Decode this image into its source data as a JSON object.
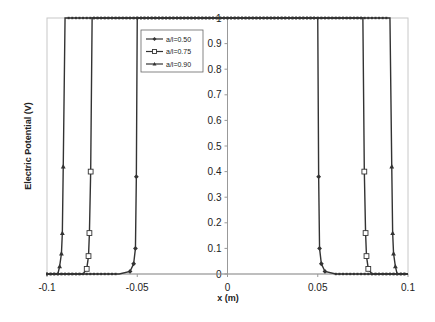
{
  "chart_data": {
    "type": "line",
    "title": "",
    "xlabel": "x (m)",
    "ylabel": "Electric Potential (V)",
    "xlim": [
      -0.1,
      0.1
    ],
    "ylim": [
      0,
      1
    ],
    "xticks": [
      -0.1,
      -0.05,
      0,
      0.05,
      0.1
    ],
    "xtick_labels": [
      "-0.1",
      "-0.05",
      "0",
      "0.05",
      "0.1"
    ],
    "yticks": [
      0,
      0.1,
      0.2,
      0.3,
      0.4,
      0.5,
      0.6,
      0.7,
      0.8,
      0.9,
      1
    ],
    "ytick_labels": [
      "0",
      "0.1",
      "0.2",
      "0.3",
      "0.4",
      "0.5",
      "0.6",
      "0.7",
      "0.8",
      "0.9",
      "1"
    ],
    "grid": false,
    "legend_position": "upper-left-inside",
    "series": [
      {
        "name": "a/l=0.50",
        "marker": "diamond",
        "x": [
          -0.1,
          -0.06,
          -0.054,
          -0.052,
          -0.051,
          -0.0505,
          -0.05,
          -0.0495,
          -0.049,
          0.049,
          0.0495,
          0.05,
          0.0505,
          0.051,
          0.052,
          0.054,
          0.06,
          0.1
        ],
        "values": [
          0,
          0,
          0.01,
          0.04,
          0.1,
          0.38,
          1,
          1,
          1,
          1,
          1,
          1,
          0.38,
          0.1,
          0.04,
          0.01,
          0,
          0
        ]
      },
      {
        "name": "a/l=0.75",
        "marker": "square",
        "x": [
          -0.1,
          -0.08,
          -0.078,
          -0.077,
          -0.0765,
          -0.0758,
          -0.075,
          -0.0745,
          0.0745,
          0.075,
          0.0758,
          0.0765,
          0.077,
          0.078,
          0.08,
          0.1
        ],
        "values": [
          0,
          0,
          0.02,
          0.07,
          0.16,
          0.4,
          1,
          1,
          1,
          1,
          0.4,
          0.16,
          0.07,
          0.02,
          0,
          0
        ],
        "note": "Curve values are 1 for |x| below ~0.075 and 0 beyond"
      },
      {
        "name": "a/l=0.90",
        "marker": "triangle",
        "x": [
          -0.1,
          -0.094,
          -0.093,
          -0.092,
          -0.0915,
          -0.091,
          -0.09,
          -0.0895,
          0.0895,
          0.09,
          0.091,
          0.0915,
          0.092,
          0.093,
          0.094,
          0.1
        ],
        "values": [
          0,
          0,
          0.03,
          0.08,
          0.16,
          0.42,
          1,
          1,
          1,
          1,
          0.42,
          0.16,
          0.08,
          0.03,
          0,
          0
        ]
      }
    ]
  },
  "legend": {
    "items": [
      {
        "label": "a/l=0.50",
        "marker": "diamond"
      },
      {
        "label": "a/l=0.75",
        "marker": "square"
      },
      {
        "label": "a/l=0.90",
        "marker": "triangle"
      }
    ]
  },
  "colors": {
    "series": "#333333",
    "axis": "#999999",
    "text": "#222222"
  }
}
